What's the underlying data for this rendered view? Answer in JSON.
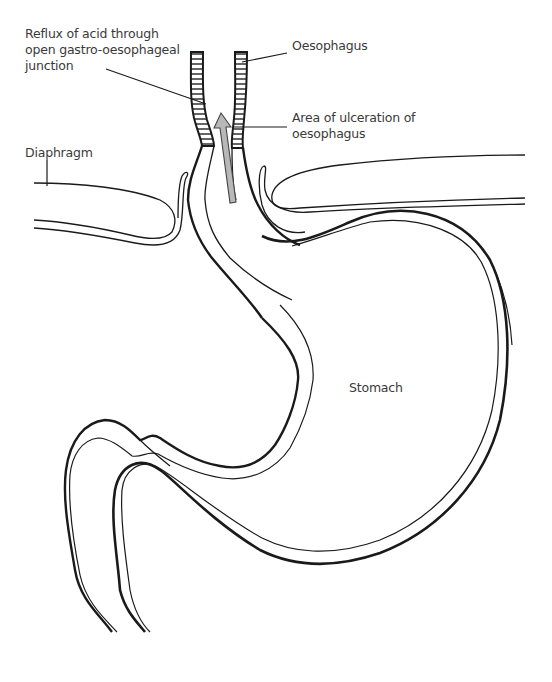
{
  "diagram": {
    "labels": {
      "reflux": "Reflux of acid through\nopen gastro-oesophageal\njunction",
      "oesophagus": "Oesophagus",
      "ulceration": "Area of ulceration of\noesophagus",
      "diaphragm": "Diaphragm",
      "stomach": "Stomach"
    },
    "colors": {
      "line": "#1a1a1a",
      "text": "#3a3a3a",
      "arrow_fill": "#b8b8b8",
      "background": "#ffffff"
    }
  }
}
